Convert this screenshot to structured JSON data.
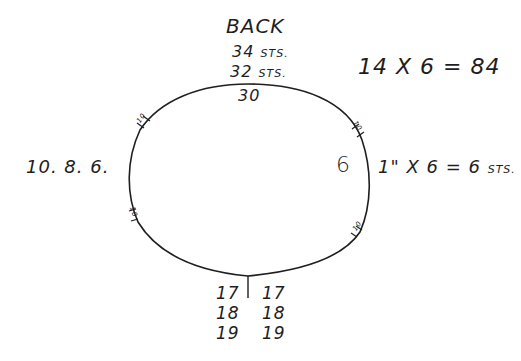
{
  "diagram": {
    "title": "BACK",
    "top_labels": {
      "line1_num": "34",
      "line1_unit": "STS.",
      "line2_num": "32",
      "line2_unit": "STS.",
      "inside_top": "30"
    },
    "right_formula_top": "14 X 6 = 84",
    "left_label": "10. 8. 6.",
    "right_inside": "6",
    "right_formula": {
      "text": "1\" X 6 = 6",
      "unit": "STS."
    },
    "bottom_left": [
      "17",
      "18",
      "19"
    ],
    "bottom_right": [
      "17",
      "18",
      "19"
    ],
    "markers": [
      "10",
      "10",
      "10",
      "10"
    ],
    "colors": {
      "ink": "#1e1e1e",
      "background": "#ffffff"
    }
  }
}
